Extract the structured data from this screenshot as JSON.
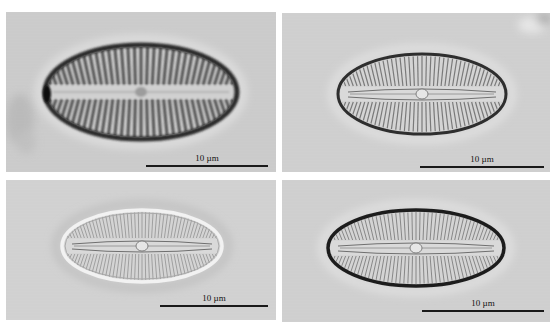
{
  "figure": {
    "layout": "2x2 grid of light micrographs",
    "background_color": "#ffffff",
    "panels": [
      {
        "position": "top-left",
        "box": {
          "x": 6,
          "y": 12,
          "w": 270,
          "h": 160
        },
        "bg_color": "#cccccc",
        "subject": "diatom valve, coarse radiate striae, dark thick outline",
        "cell": {
          "cx": 135,
          "cy": 80,
          "rx": 96,
          "ry": 47,
          "outline_color": "#2a2a2a",
          "outline_width": 5,
          "striae_count": 34,
          "striae_color": "#3a3a3a",
          "striae_width": 3.2,
          "style": "coarse"
        },
        "debris": true,
        "scale_bar": {
          "label": "10 µm",
          "x1": 140,
          "x2": 262,
          "y": 153,
          "label_y": 141
        }
      },
      {
        "position": "top-right",
        "box": {
          "x": 282,
          "y": 13,
          "w": 268,
          "h": 159
        },
        "bg_color": "#d0d0d0",
        "subject": "diatom valve, fine striae, thin dark outline",
        "cell": {
          "cx": 140,
          "cy": 81,
          "rx": 84,
          "ry": 40,
          "outline_color": "#2e2e2e",
          "outline_width": 3,
          "striae_count": 44,
          "striae_color": "#6a6a6a",
          "striae_width": 1.2,
          "style": "fine"
        },
        "debris_top_right": true,
        "scale_bar": {
          "label": "10 µm",
          "x1": 138,
          "x2": 262,
          "y": 153,
          "label_y": 141
        }
      },
      {
        "position": "bottom-left",
        "box": {
          "x": 6,
          "y": 180,
          "w": 270,
          "h": 140
        },
        "bg_color": "#d2d2d2",
        "subject": "diatom valve, bright halo outline, fine striae",
        "cell": {
          "cx": 136,
          "cy": 66,
          "rx": 80,
          "ry": 36,
          "outline_color": "#f2f2f2",
          "outline_width": 3.5,
          "striae_count": 50,
          "striae_color": "#8f8f8f",
          "striae_width": 0.9,
          "style": "bright"
        },
        "scale_bar": {
          "label": "10 µm",
          "x1": 154,
          "x2": 262,
          "y": 125,
          "label_y": 113
        }
      },
      {
        "position": "bottom-right",
        "box": {
          "x": 282,
          "y": 180,
          "w": 268,
          "h": 142
        },
        "bg_color": "#d0d0d0",
        "subject": "diatom valve, dark thick outline, fine striae",
        "cell": {
          "cx": 134,
          "cy": 68,
          "rx": 88,
          "ry": 38,
          "outline_color": "#1e1e1e",
          "outline_width": 3.5,
          "striae_count": 50,
          "striae_color": "#7a7a7a",
          "striae_width": 1,
          "style": "dark"
        },
        "scale_bar": {
          "label": "10 µm",
          "x1": 140,
          "x2": 262,
          "y": 130,
          "label_y": 118
        }
      }
    ]
  }
}
